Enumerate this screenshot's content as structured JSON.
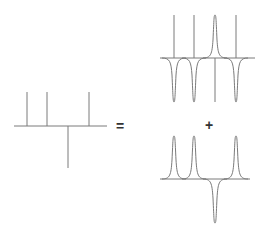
{
  "diagram": {
    "colors": {
      "line": "#7a7a7a",
      "symbol": "#333333",
      "background": "#ffffff"
    },
    "operators": {
      "equals": "=",
      "plus": "+"
    },
    "left": {
      "description": "stick spectrum: three positive sticks and one negative stick",
      "sticks": [
        {
          "x": 27,
          "direction": "up"
        },
        {
          "x": 47,
          "direction": "up"
        },
        {
          "x": 68,
          "direction": "down"
        },
        {
          "x": 89,
          "direction": "up"
        }
      ]
    },
    "top_right": {
      "description": "sticks with one positive lorentzian peak and three negative lorentzian peaks",
      "peaks": [
        {
          "x": 174,
          "direction": "down"
        },
        {
          "x": 194,
          "direction": "down"
        },
        {
          "x": 215,
          "direction": "up"
        },
        {
          "x": 236,
          "direction": "down"
        }
      ]
    },
    "bottom_right": {
      "description": "three positive lorentzian peaks and one negative lorentzian peak",
      "peaks": [
        {
          "x": 174,
          "direction": "up"
        },
        {
          "x": 194,
          "direction": "up"
        },
        {
          "x": 215,
          "direction": "down"
        },
        {
          "x": 236,
          "direction": "up"
        }
      ]
    }
  }
}
